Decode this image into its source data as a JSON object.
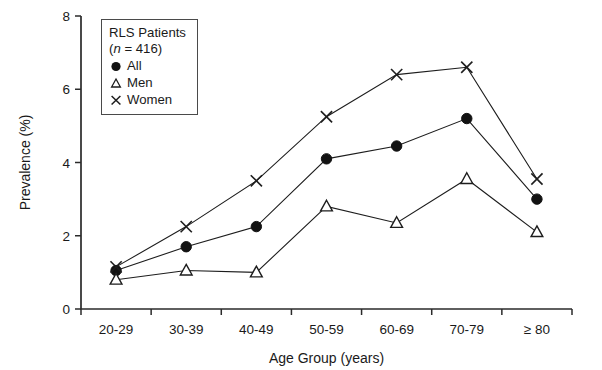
{
  "figure": {
    "legend": {
      "title": "RLS Patients",
      "n_prefix": "(",
      "n_italic": "n",
      "n_value": " = 416)",
      "entries": [
        {
          "key": "all",
          "label": "All",
          "marker": "filled-circle-icon"
        },
        {
          "key": "men",
          "label": "Men",
          "marker": "open-triangle-icon"
        },
        {
          "key": "women",
          "label": "Women",
          "marker": "cross-x-icon"
        }
      ]
    },
    "axes": {
      "x_title": "Age Group (years)",
      "y_title": "Prevalence (%)"
    }
  },
  "chart_data": {
    "type": "line",
    "title": "",
    "xlabel": "Age Group (years)",
    "ylabel": "Prevalence (%)",
    "categories": [
      "20-29",
      "30-39",
      "40-49",
      "50-59",
      "60-69",
      "70-79",
      "≥ 80"
    ],
    "ylim": [
      0,
      8
    ],
    "yticks": [
      0,
      2,
      4,
      6,
      8
    ],
    "ytick_labels": [
      "0",
      "2",
      "4",
      "6",
      "8"
    ],
    "grid": false,
    "legend_position": "upper-left-inset",
    "series": [
      {
        "name": "All",
        "marker": "filled-circle",
        "values": [
          1.05,
          1.7,
          2.25,
          4.1,
          4.45,
          5.2,
          3.0
        ]
      },
      {
        "name": "Men",
        "marker": "open-triangle",
        "values": [
          0.8,
          1.05,
          1.0,
          2.8,
          2.35,
          3.55,
          2.1
        ]
      },
      {
        "name": "Women",
        "marker": "cross-x",
        "values": [
          1.15,
          2.25,
          3.5,
          5.25,
          6.4,
          6.6,
          3.55
        ]
      }
    ]
  }
}
